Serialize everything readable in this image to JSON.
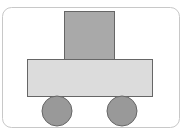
{
  "diagram": {
    "parts": [
      {
        "id": "cabin",
        "shape": "square"
      },
      {
        "id": "body",
        "shape": "rectangle"
      },
      {
        "id": "wheel-left",
        "shape": "circle"
      },
      {
        "id": "wheel-right",
        "shape": "circle"
      }
    ],
    "colors": {
      "frame_stroke": "#c8c8c8",
      "background": "#ffffff",
      "cabin_fill": "#a9a9a9",
      "body_fill": "#dcdcdc",
      "wheel_fill": "#999999",
      "shape_stroke": "#666666"
    }
  }
}
